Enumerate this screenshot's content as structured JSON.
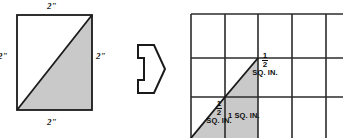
{
  "figure": {
    "colors": {
      "shade": "#c9c9c9",
      "stroke": "#1a1a1a",
      "grid": "#2b2b2b",
      "background": "#ffffff"
    }
  },
  "left_square": {
    "name": "two-inch-square-with-diagonal",
    "dimensions": {
      "top": "2\"",
      "right": "2\"",
      "left": "2\"",
      "bottom": "2\""
    },
    "shaded_region": "lower-right triangle"
  },
  "arrow": {
    "name": "right-pointing-arrow",
    "direction": "right",
    "style": "outlined"
  },
  "right_grid": {
    "name": "one-inch-grid",
    "columns": 5,
    "rows": 3,
    "cell_unit": "1 SQ. IN.",
    "labels": {
      "half_upper": {
        "numerator": "1",
        "denominator": "2",
        "unit": "SQ. IN."
      },
      "full_cell": "1 SQ. IN.",
      "half_lower": {
        "numerator": "1",
        "denominator": "2",
        "unit": "SQ. IN."
      }
    }
  }
}
